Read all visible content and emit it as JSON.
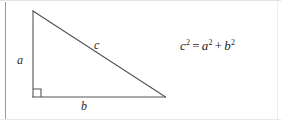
{
  "figure": {
    "stroke_color": "#555555",
    "background_color": "#ffffff",
    "border_color": "#9a9a9a",
    "triangle": {
      "type": "right-triangle",
      "vertices": {
        "apex": [
          33,
          11
        ],
        "right_angle": [
          33,
          97
        ],
        "base_right": [
          165,
          97
        ]
      },
      "right_angle_marker": {
        "size": 8,
        "position": [
          33,
          89
        ]
      }
    },
    "labels": {
      "leg_vertical": "a",
      "hypotenuse": "c",
      "leg_horizontal": "b"
    }
  },
  "equation": {
    "left_base": "c",
    "left_exponent": "2",
    "equals": "=",
    "term1_base": "a",
    "term1_exponent": "2",
    "plus": "+",
    "term2_base": "b",
    "term2_exponent": "2",
    "plain_text": "c2 = a2 + b2"
  }
}
